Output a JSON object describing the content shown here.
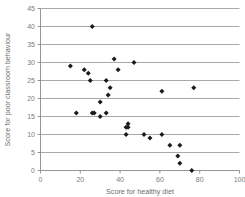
{
  "chart_data": {
    "type": "scatter",
    "title": "",
    "xlabel": "Score for healthy diet",
    "ylabel": "Score for poor classroom behaviour",
    "xlim": [
      0,
      100
    ],
    "ylim": [
      0,
      45
    ],
    "xticks": [
      0,
      20,
      40,
      60,
      80,
      100
    ],
    "yticks": [
      0,
      5,
      10,
      15,
      20,
      25,
      30,
      35,
      40,
      45
    ],
    "xtick_labels": [
      "0",
      "20",
      "40",
      "60",
      "80",
      "100"
    ],
    "ytick_labels": [
      "0",
      "5",
      "10",
      "15",
      "20",
      "25",
      "30",
      "35",
      "40",
      "45"
    ],
    "grid": "horizontal",
    "legend": "none",
    "marker_color": "#1b1b1b",
    "marker_shape": "diamond",
    "points": [
      {
        "x": 26,
        "y": 40
      },
      {
        "x": 15,
        "y": 29
      },
      {
        "x": 37,
        "y": 31
      },
      {
        "x": 47,
        "y": 30
      },
      {
        "x": 22,
        "y": 28
      },
      {
        "x": 39,
        "y": 28
      },
      {
        "x": 24,
        "y": 27
      },
      {
        "x": 25,
        "y": 25
      },
      {
        "x": 33,
        "y": 25
      },
      {
        "x": 35,
        "y": 23
      },
      {
        "x": 77,
        "y": 23
      },
      {
        "x": 61,
        "y": 22
      },
      {
        "x": 34,
        "y": 21
      },
      {
        "x": 30,
        "y": 19
      },
      {
        "x": 18,
        "y": 16
      },
      {
        "x": 26,
        "y": 16
      },
      {
        "x": 27,
        "y": 16
      },
      {
        "x": 33,
        "y": 16
      },
      {
        "x": 30,
        "y": 15
      },
      {
        "x": 44,
        "y": 13
      },
      {
        "x": 43,
        "y": 12
      },
      {
        "x": 44,
        "y": 12
      },
      {
        "x": 43,
        "y": 10
      },
      {
        "x": 52,
        "y": 10
      },
      {
        "x": 61,
        "y": 10
      },
      {
        "x": 55,
        "y": 9
      },
      {
        "x": 65,
        "y": 7
      },
      {
        "x": 70,
        "y": 7
      },
      {
        "x": 69,
        "y": 4
      },
      {
        "x": 70,
        "y": 2
      },
      {
        "x": 76,
        "y": 0
      }
    ]
  }
}
